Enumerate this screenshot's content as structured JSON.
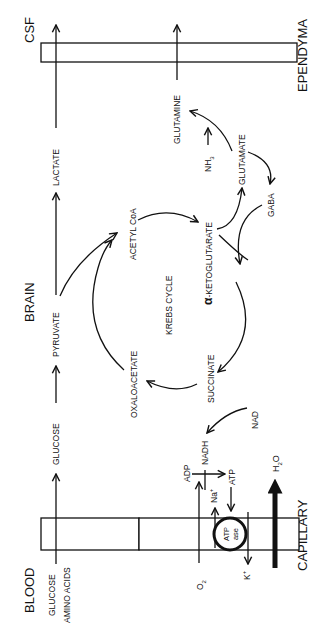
{
  "diagram": {
    "orientation": "rotated 90 degrees counter-clockwise",
    "regions": {
      "blood": "BLOOD",
      "brain": "BRAIN",
      "csf": "CSF"
    },
    "barriers": {
      "capillary": "CAPILLARY",
      "ependyma": "EPENDYMA"
    },
    "blood_inputs": {
      "glucose": "GLUCOSE",
      "amino_acids": "AMINO ACIDS"
    },
    "main_pathway": {
      "glucose": "GLUCOSE",
      "pyruvate": "PYRUVATE",
      "lactate": "LACTATE"
    },
    "krebs": {
      "title": "KREBS CYCLE",
      "acetyl_coa": "ACETYL CoA",
      "alpha_prefix": "α",
      "ketoglutarate": "-KETOGLUTARATE",
      "succinate": "SUCCINATE",
      "oxaloacetate": "OXALOACETATE"
    },
    "glutamate_shunt": {
      "glutamate": "GLUTAMATE",
      "gaba": "GABA",
      "glutamine": "GLUTAMINE",
      "nh3_main": "NH",
      "nh3_sub": "3"
    },
    "energy": {
      "nad": "NAD",
      "nadh": "NADH",
      "adp": "ADP",
      "atp": "ATP",
      "na_main": "Na",
      "na_sup": "+",
      "k_main": "K",
      "k_sup": "+",
      "o2_main": "O",
      "o2_sub": "2",
      "atpase_line1": "ATP",
      "atpase_line2": "ase",
      "h2o_main": "H",
      "h2o_sub": "2",
      "h2o_tail": "O"
    },
    "colors": {
      "ink": "#111111",
      "background": "#ffffff"
    }
  }
}
